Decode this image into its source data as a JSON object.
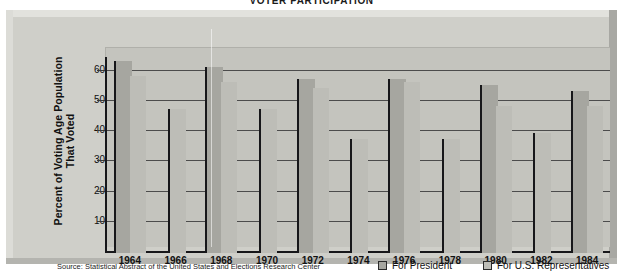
{
  "chart_data": {
    "type": "bar",
    "title": "VOTER PARTICIPATION",
    "xlabel": "",
    "ylabel": "Percent of Voting Age Population That Voted",
    "ylim": [
      0,
      66
    ],
    "yticks": [
      10,
      20,
      30,
      40,
      50,
      60
    ],
    "grid": true,
    "legend_position": "bottom-right",
    "categories": [
      "1964",
      "1966",
      "1968",
      "1970",
      "1972",
      "1974",
      "1976",
      "1978",
      "1980",
      "1982",
      "1984"
    ],
    "series": [
      {
        "name": "For President",
        "color": "#a6a6a0",
        "values": [
          63,
          null,
          61,
          null,
          57,
          null,
          57,
          null,
          55,
          null,
          53
        ]
      },
      {
        "name": "For U.S. Representatives",
        "color": "#bdbdb7",
        "values": [
          58,
          47,
          56,
          47,
          54,
          37,
          56,
          37,
          48,
          39,
          48
        ]
      }
    ],
    "source": "Source: Statistical Abstract of the United States and Elections Research Center"
  },
  "legend": {
    "president_label": "For President",
    "representatives_label": "For U.S. Representatives"
  },
  "axis": {
    "y_label": "Percent of Voting Age Population That Voted",
    "y_ticks": [
      "60",
      "50",
      "40",
      "30",
      "20",
      "10"
    ],
    "x_ticks": [
      "1964",
      "1966",
      "1968",
      "1970",
      "1972",
      "1974",
      "1976",
      "1978",
      "1980",
      "1982",
      "1984"
    ]
  },
  "footer": {
    "source": "Source: Statistical Abstract of the United States and Elections Research Center"
  },
  "header": {
    "title": "VOTER PARTICIPATION"
  }
}
